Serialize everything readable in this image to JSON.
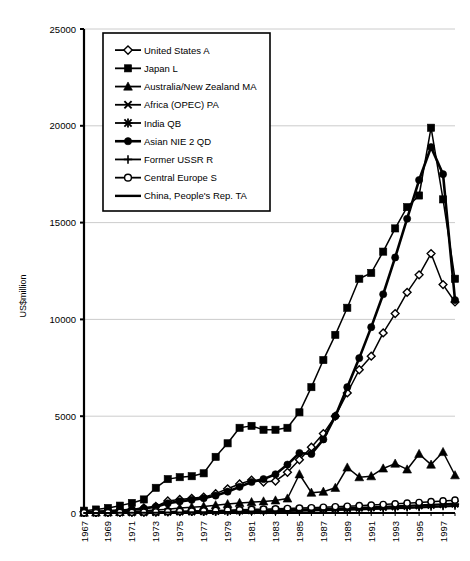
{
  "chart_data": {
    "type": "line",
    "title": "",
    "subtitle": "",
    "xlabel": "",
    "ylabel": "US$million",
    "xlim": [
      1967,
      1998
    ],
    "ylim": [
      0,
      25000
    ],
    "grid": true,
    "legend_position": "top-left-inside",
    "y_ticks": [
      0,
      5000,
      10000,
      15000,
      20000,
      25000
    ],
    "y_tick_labels": [
      "0",
      "5000",
      "10000",
      "15000",
      "20000",
      "25000"
    ],
    "x": [
      1967,
      1968,
      1969,
      1970,
      1971,
      1972,
      1973,
      1974,
      1975,
      1976,
      1977,
      1978,
      1979,
      1980,
      1981,
      1982,
      1983,
      1984,
      1985,
      1986,
      1987,
      1988,
      1989,
      1990,
      1991,
      1992,
      1993,
      1994,
      1995,
      1996,
      1997,
      1998
    ],
    "x_tick_labels": [
      "1967",
      "1969",
      "1971",
      "1973",
      "1975",
      "1977",
      "1979",
      "1981",
      "1983",
      "1985",
      "1987",
      "1989",
      "1991",
      "1993",
      "1995",
      "1997"
    ],
    "x_ticks": [
      1967,
      1969,
      1971,
      1973,
      1975,
      1977,
      1979,
      1981,
      1983,
      1985,
      1987,
      1989,
      1991,
      1993,
      1995,
      1997
    ],
    "series": [
      {
        "name": "United States A",
        "marker": "diamond-open",
        "values": [
          60,
          80,
          110,
          150,
          200,
          260,
          340,
          620,
          700,
          760,
          820,
          1000,
          1250,
          1500,
          1700,
          1600,
          1650,
          2100,
          2750,
          3400,
          4100,
          5000,
          6200,
          7400,
          8100,
          9300,
          10300,
          11400,
          12300,
          13400,
          11800,
          10900
        ]
      },
      {
        "name": "Japan L",
        "marker": "square-filled",
        "values": [
          120,
          180,
          260,
          380,
          520,
          700,
          1300,
          1750,
          1850,
          1900,
          2050,
          2900,
          3600,
          4400,
          4500,
          4300,
          4300,
          4400,
          5200,
          6500,
          7900,
          9200,
          10600,
          12100,
          12400,
          13500,
          14700,
          15800,
          16400,
          19900,
          16200,
          12100
        ]
      },
      {
        "name": "Australia/New Zealand MA",
        "marker": "triangle-filled",
        "values": [
          20,
          30,
          40,
          55,
          80,
          110,
          150,
          200,
          260,
          300,
          340,
          400,
          460,
          520,
          560,
          600,
          650,
          750,
          2000,
          1050,
          1100,
          1300,
          2350,
          1850,
          1900,
          2300,
          2550,
          2250,
          3050,
          2500,
          3150,
          1950
        ]
      },
      {
        "name": "Africa (OPEC) PA",
        "marker": "x",
        "values": [
          10,
          14,
          18,
          22,
          28,
          34,
          42,
          60,
          70,
          80,
          90,
          100,
          115,
          130,
          145,
          150,
          160,
          175,
          190,
          205,
          225,
          245,
          265,
          290,
          310,
          335,
          360,
          385,
          410,
          440,
          470,
          500
        ]
      },
      {
        "name": "India QB",
        "marker": "star",
        "values": [
          8,
          11,
          14,
          18,
          23,
          28,
          35,
          48,
          58,
          66,
          75,
          86,
          98,
          110,
          122,
          130,
          140,
          152,
          166,
          180,
          196,
          214,
          232,
          252,
          272,
          296,
          320,
          345,
          372,
          400,
          430,
          460
        ]
      },
      {
        "name": "Asian NIE 2 QD",
        "marker": "circle-filled",
        "values": [
          40,
          60,
          85,
          120,
          170,
          230,
          320,
          500,
          600,
          680,
          760,
          900,
          1100,
          1350,
          1600,
          1750,
          2000,
          2500,
          3100,
          3050,
          3800,
          5000,
          6500,
          8000,
          9600,
          11300,
          13200,
          15200,
          17200,
          18900,
          17500,
          11000
        ]
      },
      {
        "name": "Former USSR R",
        "marker": "plus",
        "values": [
          5,
          7,
          9,
          12,
          15,
          19,
          24,
          32,
          40,
          48,
          56,
          64,
          74,
          84,
          94,
          102,
          112,
          122,
          134,
          146,
          160,
          175,
          190,
          206,
          222,
          240,
          258,
          278,
          298,
          320,
          344,
          368
        ]
      },
      {
        "name": "Central Europe S",
        "marker": "circle-open",
        "values": [
          12,
          16,
          20,
          26,
          33,
          42,
          54,
          70,
          85,
          98,
          112,
          128,
          145,
          165,
          185,
          200,
          215,
          235,
          255,
          275,
          300,
          325,
          350,
          380,
          410,
          440,
          475,
          510,
          545,
          585,
          625,
          665
        ]
      },
      {
        "name": "China, People's Rep. TA",
        "marker": "line-plain",
        "values": [
          3,
          4,
          6,
          8,
          10,
          13,
          17,
          22,
          28,
          34,
          40,
          47,
          55,
          63,
          72,
          80,
          90,
          100,
          112,
          124,
          138,
          152,
          168,
          184,
          202,
          220,
          240,
          262,
          284,
          308,
          334,
          360
        ]
      }
    ]
  },
  "axis": {
    "y_axis_title": "US$million"
  },
  "legend": {
    "entries": [
      {
        "label": "United States A",
        "marker": "diamond-open"
      },
      {
        "label": "Japan L",
        "marker": "square-filled"
      },
      {
        "label": "Australia/New Zealand MA",
        "marker": "triangle-filled"
      },
      {
        "label": "Africa (OPEC) PA",
        "marker": "x"
      },
      {
        "label": "India QB",
        "marker": "star"
      },
      {
        "label": "Asian NIE 2 QD",
        "marker": "circle-filled"
      },
      {
        "label": "Former USSR R",
        "marker": "plus"
      },
      {
        "label": "Central Europe S",
        "marker": "circle-open"
      },
      {
        "label": "China, People's Rep. TA",
        "marker": "line-plain"
      }
    ]
  },
  "colors": {
    "ink": "#000000",
    "grid": "#bfbfbf",
    "background": "#ffffff"
  }
}
